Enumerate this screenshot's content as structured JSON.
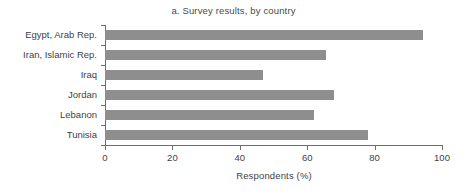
{
  "chart_data": {
    "type": "bar",
    "orientation": "horizontal",
    "title": "a. Survey results, by country",
    "xlabel": "Respondents (%)",
    "ylabel": "",
    "xlim": [
      0,
      100
    ],
    "xticks": [
      0,
      20,
      40,
      60,
      80,
      100
    ],
    "xtick_labels": [
      "0",
      "20",
      "40",
      "60",
      "80",
      "100"
    ],
    "grid": false,
    "legend": null,
    "bar_color": "#8e8e8e",
    "axis_color": "#6e6e6e",
    "text_color": "#3f3f3f",
    "categories": [
      "Egypt, Arab Rep.",
      "Iran, Islamic Rep.",
      "Iraq",
      "Jordan",
      "Lebanon",
      "Tunisia"
    ],
    "values": [
      94.5,
      65.5,
      47.0,
      68.0,
      62.0,
      78.0
    ],
    "bars": [
      {
        "label": "Egypt, Arab Rep.",
        "value": 94.5
      },
      {
        "label": "Iran, Islamic Rep.",
        "value": 65.5
      },
      {
        "label": "Iraq",
        "value": 47.0
      },
      {
        "label": "Jordan",
        "value": 68.0
      },
      {
        "label": "Lebanon",
        "value": 62.0
      },
      {
        "label": "Tunisia",
        "value": 78.0
      }
    ]
  }
}
